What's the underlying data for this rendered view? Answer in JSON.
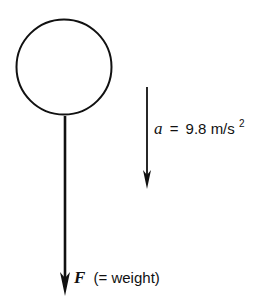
{
  "diagram": {
    "type": "free-body diagram",
    "body": {
      "shape": "circle"
    },
    "force_arrow": {
      "symbol": "F",
      "note": "(= weight)",
      "direction": "down"
    },
    "acceleration_arrow": {
      "symbol": "a",
      "equals": "=",
      "value": "9.8 m/s",
      "exponent": "2",
      "direction": "down"
    }
  }
}
